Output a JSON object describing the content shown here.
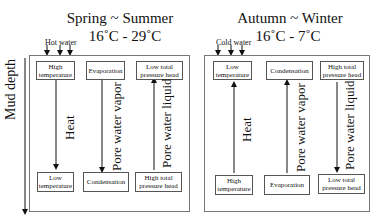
{
  "depth_label": "Mud depth",
  "panels": [
    {
      "title": "Spring ~ Summer",
      "temperature": "16˚C - 29˚C",
      "water_label": "Hot water",
      "top_boxes": [
        "High temperature",
        "Evaporation",
        "Low total pressure head"
      ],
      "bottom_boxes": [
        "Low temperature",
        "Condensation",
        "High total pressure head"
      ],
      "flows": [
        {
          "label": "Heat",
          "direction": "down"
        },
        {
          "label": "Pore water vapor",
          "direction": "down"
        },
        {
          "label": "Pore water liquid",
          "direction": "up"
        }
      ]
    },
    {
      "title": "Autumn ~ Winter",
      "temperature": "16˚C - 7˚C",
      "water_label": "Cold water",
      "top_boxes": [
        "Low temperature",
        "Condensation",
        "High total pressure head"
      ],
      "bottom_boxes": [
        "High temperature",
        "Evaporation",
        "Low total pressure head"
      ],
      "flows": [
        {
          "label": "Heat",
          "direction": "up"
        },
        {
          "label": "Pore water vapor",
          "direction": "up"
        },
        {
          "label": "Pore water liquid",
          "direction": "down"
        }
      ]
    }
  ]
}
